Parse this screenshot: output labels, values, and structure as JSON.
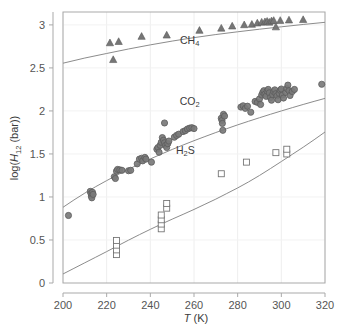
{
  "chart_data": {
    "type": "scatter",
    "title": "",
    "xlabel": "T (K)",
    "ylabel": "log(H12 (bar))",
    "xlim": [
      200,
      320
    ],
    "ylim": [
      0,
      3.15
    ],
    "xticks": [
      200,
      220,
      240,
      260,
      280,
      300,
      320
    ],
    "yticks": [
      0,
      0.5,
      1,
      1.5,
      2,
      2.5,
      3
    ],
    "xtick_labels": [
      "200",
      "220",
      "240",
      "260",
      "280",
      "300",
      "320"
    ],
    "ytick_labels": [
      "0",
      "0.5",
      "1",
      "1.5",
      "2",
      "2.5",
      "3"
    ],
    "grid": "faint-vertical-and-horizontal",
    "legend_position": "inline-annotations",
    "annotations": [
      {
        "text": "CH4",
        "x": 258,
        "y": 2.78,
        "label_html": "CH<sub>4</sub>"
      },
      {
        "text": "CO2",
        "x": 258,
        "y": 2.07,
        "label_html": "CO<sub>2</sub>"
      },
      {
        "text": "H2S",
        "x": 256,
        "y": 1.5,
        "label_html": "H<sub>2</sub>S"
      }
    ],
    "series": [
      {
        "name": "CH4",
        "marker": "triangle",
        "marker_color": "#767676",
        "marker_edge_color": "#5a5a5a",
        "curve_color": "#8c8c8c",
        "points": [
          [
            221.5,
            2.79
          ],
          [
            223.0,
            2.595
          ],
          [
            225.5,
            2.805
          ],
          [
            236.0,
            2.865
          ],
          [
            247.5,
            2.88
          ],
          [
            262.5,
            2.935
          ],
          [
            272.5,
            2.96
          ],
          [
            277.5,
            2.985
          ],
          [
            283.0,
            3.0
          ],
          [
            286.5,
            3.005
          ],
          [
            289.0,
            3.02
          ],
          [
            291.0,
            3.03
          ],
          [
            292.5,
            3.035
          ],
          [
            293.5,
            3.04
          ],
          [
            294.5,
            3.03
          ],
          [
            295.5,
            3.045
          ],
          [
            296.5,
            3.05
          ],
          [
            297.5,
            2.975
          ],
          [
            299.5,
            3.05
          ],
          [
            303.5,
            3.055
          ],
          [
            310.0,
            3.06
          ]
        ],
        "curve": [
          [
            200,
            2.555
          ],
          [
            210,
            2.615
          ],
          [
            220,
            2.668
          ],
          [
            230,
            2.72
          ],
          [
            240,
            2.768
          ],
          [
            250,
            2.812
          ],
          [
            260,
            2.852
          ],
          [
            270,
            2.888
          ],
          [
            280,
            2.92
          ],
          [
            290,
            2.95
          ],
          [
            300,
            2.978
          ],
          [
            310,
            3.005
          ],
          [
            320,
            3.03
          ]
        ]
      },
      {
        "name": "CO2",
        "marker": "circle",
        "marker_color": "#7a7a7a",
        "marker_edge_color": "#5c5c5c",
        "curve_color": "#8c8c8c",
        "points": [
          [
            202.5,
            0.785
          ],
          [
            212.5,
            1.065
          ],
          [
            212.8,
            1.04
          ],
          [
            213.0,
            1.01
          ],
          [
            213.2,
            0.99
          ],
          [
            213.5,
            1.055
          ],
          [
            213.8,
            1.03
          ],
          [
            223.5,
            1.235
          ],
          [
            224.0,
            1.215
          ],
          [
            224.5,
            1.3
          ],
          [
            225.0,
            1.32
          ],
          [
            226.0,
            1.315
          ],
          [
            227.0,
            1.31
          ],
          [
            230.0,
            1.305
          ],
          [
            231.0,
            1.31
          ],
          [
            234.0,
            1.385
          ],
          [
            235.0,
            1.44
          ],
          [
            236.0,
            1.45
          ],
          [
            236.5,
            1.42
          ],
          [
            237.5,
            1.46
          ],
          [
            238.0,
            1.44
          ],
          [
            240.5,
            1.405
          ],
          [
            243.0,
            1.555
          ],
          [
            243.5,
            1.575
          ],
          [
            244.0,
            1.52
          ],
          [
            244.5,
            1.6
          ],
          [
            245.0,
            1.635
          ],
          [
            245.5,
            1.69
          ],
          [
            246.0,
            1.66
          ],
          [
            246.5,
            1.63
          ],
          [
            247.0,
            1.6
          ],
          [
            247.5,
            1.575
          ],
          [
            248.0,
            1.62
          ],
          [
            248.5,
            1.65
          ],
          [
            246.5,
            1.86
          ],
          [
            251.0,
            1.695
          ],
          [
            252.0,
            1.715
          ],
          [
            253.0,
            1.73
          ],
          [
            255.0,
            1.76
          ],
          [
            256.0,
            1.77
          ],
          [
            257.0,
            1.79
          ],
          [
            258.0,
            1.8
          ],
          [
            259.0,
            1.805
          ],
          [
            260.0,
            1.795
          ],
          [
            272.5,
            1.915
          ],
          [
            272.8,
            1.89
          ],
          [
            273.0,
            1.855
          ],
          [
            273.2,
            1.775
          ],
          [
            273.5,
            1.96
          ],
          [
            274.0,
            1.94
          ],
          [
            281.5,
            2.045
          ],
          [
            282.5,
            2.06
          ],
          [
            283.5,
            2.03
          ],
          [
            284.5,
            2.055
          ],
          [
            286.0,
            1.985
          ],
          [
            288.0,
            2.11
          ],
          [
            289.0,
            2.1
          ],
          [
            290.0,
            2.14
          ],
          [
            290.5,
            2.075
          ],
          [
            291.0,
            2.185
          ],
          [
            291.5,
            2.215
          ],
          [
            292.0,
            2.235
          ],
          [
            292.5,
            2.195
          ],
          [
            293.0,
            2.17
          ],
          [
            293.5,
            2.23
          ],
          [
            294.0,
            2.25
          ],
          [
            294.5,
            2.21
          ],
          [
            295.0,
            2.155
          ],
          [
            295.5,
            2.125
          ],
          [
            296.0,
            2.19
          ],
          [
            296.5,
            2.225
          ],
          [
            297.0,
            2.245
          ],
          [
            297.5,
            2.2
          ],
          [
            298.0,
            2.175
          ],
          [
            298.5,
            2.13
          ],
          [
            299.0,
            2.205
          ],
          [
            299.5,
            2.24
          ],
          [
            300.0,
            2.255
          ],
          [
            300.5,
            2.185
          ],
          [
            301.0,
            2.15
          ],
          [
            302.0,
            2.215
          ],
          [
            302.5,
            2.26
          ],
          [
            303.0,
            2.3
          ],
          [
            303.5,
            2.235
          ],
          [
            304.0,
            2.18
          ],
          [
            305.0,
            2.225
          ],
          [
            306.0,
            2.25
          ],
          [
            318.5,
            2.31
          ]
        ],
        "curve": [
          [
            200,
            0.88
          ],
          [
            205,
            0.965
          ],
          [
            210,
            1.045
          ],
          [
            215,
            1.12
          ],
          [
            220,
            1.19
          ],
          [
            225,
            1.258
          ],
          [
            230,
            1.322
          ],
          [
            235,
            1.383
          ],
          [
            240,
            1.442
          ],
          [
            245,
            1.498
          ],
          [
            250,
            1.552
          ],
          [
            255,
            1.604
          ],
          [
            260,
            1.654
          ],
          [
            265,
            1.702
          ],
          [
            270,
            1.749
          ],
          [
            275,
            1.794
          ],
          [
            280,
            1.838
          ],
          [
            285,
            1.88
          ],
          [
            290,
            1.921
          ],
          [
            295,
            1.961
          ],
          [
            300,
            2.0
          ],
          [
            305,
            2.038
          ],
          [
            310,
            2.075
          ],
          [
            315,
            2.111
          ],
          [
            320,
            2.146
          ]
        ]
      },
      {
        "name": "H2S",
        "marker": "open-square",
        "marker_color": "#ffffff",
        "marker_edge_color": "#6f6f6f",
        "curve_color": "#8c8c8c",
        "points": [
          [
            224.5,
            0.33
          ],
          [
            224.5,
            0.385
          ],
          [
            224.5,
            0.44
          ],
          [
            224.5,
            0.495
          ],
          [
            245.0,
            0.63
          ],
          [
            245.0,
            0.685
          ],
          [
            245.0,
            0.735
          ],
          [
            245.0,
            0.79
          ],
          [
            247.5,
            0.87
          ],
          [
            247.5,
            0.925
          ],
          [
            272.5,
            1.27
          ],
          [
            284.0,
            1.405
          ],
          [
            297.5,
            1.515
          ],
          [
            302.5,
            1.5
          ],
          [
            302.5,
            1.555
          ]
        ],
        "curve": [
          [
            200,
            0.105
          ],
          [
            205,
            0.17
          ],
          [
            210,
            0.235
          ],
          [
            215,
            0.3
          ],
          [
            220,
            0.365
          ],
          [
            225,
            0.432
          ],
          [
            230,
            0.498
          ],
          [
            235,
            0.562
          ],
          [
            240,
            0.624
          ],
          [
            245,
            0.684
          ],
          [
            250,
            0.742
          ],
          [
            255,
            0.798
          ],
          [
            260,
            0.855
          ],
          [
            265,
            0.915
          ],
          [
            270,
            0.975
          ],
          [
            275,
            1.04
          ],
          [
            280,
            1.105
          ],
          [
            285,
            1.175
          ],
          [
            290,
            1.25
          ],
          [
            295,
            1.33
          ],
          [
            300,
            1.412
          ],
          [
            305,
            1.495
          ],
          [
            310,
            1.578
          ],
          [
            315,
            1.665
          ],
          [
            320,
            1.755
          ]
        ]
      }
    ]
  }
}
